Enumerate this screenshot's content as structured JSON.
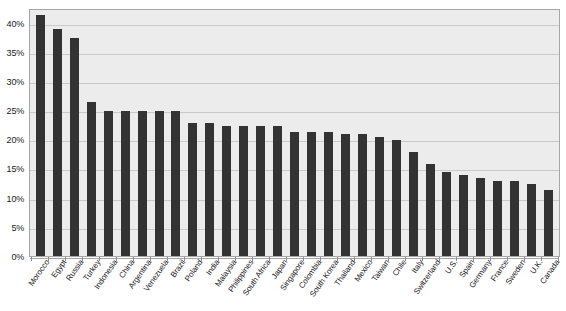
{
  "chart_data": {
    "type": "bar",
    "title": "",
    "xlabel": "",
    "ylabel": "",
    "ylim": [
      0,
      42.5
    ],
    "grid": true,
    "legend": "none",
    "y_ticks": [
      {
        "value": 0,
        "label": "0%"
      },
      {
        "value": 5,
        "label": "5%"
      },
      {
        "value": 10,
        "label": "10%"
      },
      {
        "value": 15,
        "label": "15%"
      },
      {
        "value": 20,
        "label": "20%"
      },
      {
        "value": 25,
        "label": "25%"
      },
      {
        "value": 30,
        "label": "30%"
      },
      {
        "value": 35,
        "label": "35%"
      },
      {
        "value": 40,
        "label": "40%"
      }
    ],
    "categories": [
      "Morocco",
      "Egypt",
      "Russia",
      "Turkey",
      "Indonesia",
      "China",
      "Argentina",
      "Venezuela",
      "Brazil",
      "Poland",
      "India",
      "Malaysia",
      "Philippines",
      "South Africa",
      "Japan",
      "Singapore",
      "Colombia",
      "South Korea",
      "Thailand",
      "Mexico",
      "Taiwan",
      "Chile",
      "Italy",
      "Switzerland",
      "U.S.",
      "Spain",
      "Germany",
      "France",
      "Sweden",
      "U.K.",
      "Canada"
    ],
    "values": [
      41.5,
      39.0,
      37.5,
      26.5,
      25.0,
      25.0,
      25.0,
      25.0,
      25.0,
      23.0,
      23.0,
      22.5,
      22.5,
      22.5,
      22.5,
      21.5,
      21.5,
      21.5,
      21.0,
      21.0,
      20.5,
      20.0,
      18.0,
      16.0,
      14.5,
      14.0,
      13.5,
      13.0,
      13.0,
      12.5,
      11.5
    ],
    "bar_color": "#333333",
    "plot_background": "#ececec",
    "gridline_color": "#c9c9c9",
    "axis_color": "#a6a6a6"
  }
}
